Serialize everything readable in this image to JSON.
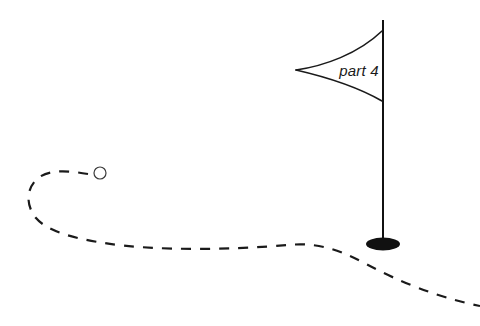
{
  "canvas": {
    "width": 480,
    "height": 326,
    "background_color": "#ffffff"
  },
  "illustration": {
    "title": "part 4",
    "description": "Dashed curving path leading from a small circle past a flag marker"
  },
  "flag": {
    "label": "part 4",
    "label_color": "#1a1a1a",
    "label_x": 359,
    "label_y": 76,
    "pennant": {
      "stroke_color": "#1a1a1a",
      "stroke_width": 1.6,
      "fill": "none",
      "tip_x": 296,
      "tip_y": 70,
      "top_attach_x": 382,
      "top_attach_y": 31,
      "bottom_attach_x": 382,
      "bottom_attach_y": 101
    },
    "pole": {
      "stroke_color": "#111111",
      "stroke_width": 2,
      "top_x": 383,
      "top_y": 20,
      "bottom_x": 383,
      "bottom_y": 244
    },
    "base": {
      "fill_color": "#111111",
      "center_x": 383,
      "center_y": 244,
      "radius_x": 17,
      "radius_y": 6.5
    }
  },
  "ball": {
    "stroke_color": "#3a3a3a",
    "fill": "none",
    "stroke_width": 1.2,
    "center_x": 100,
    "center_y": 173,
    "radius": 6
  },
  "path": {
    "stroke_color": "#1a1a1a",
    "stroke_width": 2.2,
    "fill": "none",
    "dash_length": 10,
    "dash_gap": 9,
    "start_x": 88,
    "start_y": 174,
    "end_x": 480,
    "end_y": 306,
    "d": "M 88 174 C 70 171, 48 168, 36 180 C 26 190, 26 206, 36 218 C 47 231, 72 238, 104 243 C 152 251, 232 250, 288 245 C 318 242, 340 250, 366 264 C 398 281, 436 297, 480 306"
  }
}
